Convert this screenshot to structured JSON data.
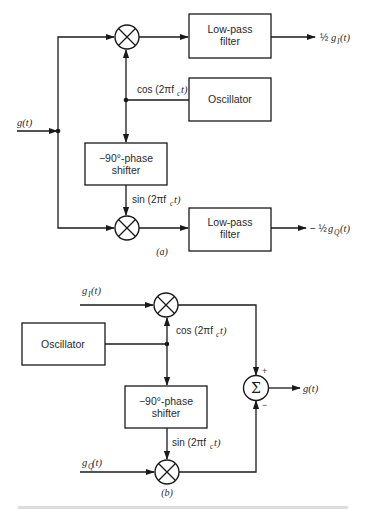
{
  "diagram_a": {
    "label": "(a)",
    "input_signal": "g(t)",
    "blocks": {
      "lpf_top_line1": "Low-pass",
      "lpf_top_line2": "filter",
      "oscillator": "Oscillator",
      "phase_shifter_line1": "−90°-phase",
      "phase_shifter_line2": "shifter",
      "lpf_bottom_line1": "Low-pass",
      "lpf_bottom_line2": "filter"
    },
    "carrier_cos": {
      "prefix": "cos (2πf",
      "sub": "c",
      "suffix": "t)"
    },
    "carrier_sin": {
      "prefix": "sin (2πf",
      "sub": "c",
      "suffix": "t)"
    },
    "output_top": {
      "coef": "½",
      "sym": "g",
      "sub": "I",
      "arg": "(t)"
    },
    "output_bottom": {
      "coef": "− ½",
      "sym": "g",
      "sub": "Q",
      "arg": "(t)"
    }
  },
  "diagram_b": {
    "label": "(b)",
    "input_i": {
      "sym": "g",
      "sub": "I",
      "arg": "(t)"
    },
    "input_q": {
      "sym": "g",
      "sub": "Q",
      "arg": "(t)"
    },
    "blocks": {
      "oscillator": "Oscillator",
      "phase_shifter_line1": "−90°-phase",
      "phase_shifter_line2": "shifter"
    },
    "carrier_cos": {
      "prefix": "cos (2πf",
      "sub": "c",
      "suffix": "t)"
    },
    "carrier_sin": {
      "prefix": "sin (2πf",
      "sub": "c",
      "suffix": "t)"
    },
    "summer": {
      "symbol": "Σ",
      "plus": "+",
      "minus": "−"
    },
    "output": "g(t)"
  }
}
